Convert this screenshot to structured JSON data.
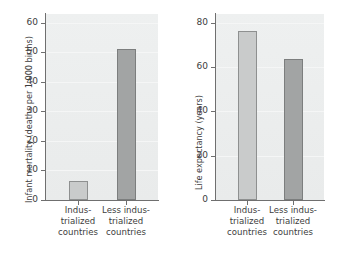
{
  "figure": {
    "background": "#ffffff",
    "plot_background": "#eceeee",
    "bar_color_light": "#c9cbcb",
    "bar_color_dark": "#a2a4a4",
    "bar_border": "#8a8a8a",
    "axis_color": "#6f6f6f"
  },
  "chart_data": [
    {
      "type": "bar",
      "title": "",
      "xlabel": "",
      "ylabel": "Infant mortality (deaths per 1,000 births)",
      "categories": [
        "Indus-\ntrialized\ncountries",
        "Less indus-\ntrialized\ncountries"
      ],
      "values": [
        6.5,
        51
      ],
      "ylim": [
        0,
        63
      ],
      "yticks": [
        0,
        10,
        20,
        30,
        40,
        50,
        60
      ],
      "ytick_labels": [
        "0",
        "10",
        "20",
        "30",
        "40",
        "50",
        "60"
      ],
      "grid": true,
      "legend": "none",
      "bar_colors": [
        "#c9cbcb",
        "#a2a4a4"
      ]
    },
    {
      "type": "bar",
      "title": "",
      "xlabel": "",
      "ylabel": "Life expectancy (years)",
      "categories": [
        "Indus-\ntrialized\ncountries",
        "Less indus-\ntrialized\ncountries"
      ],
      "values": [
        76.5,
        63.5
      ],
      "ylim": [
        0,
        84
      ],
      "yticks": [
        0,
        20,
        40,
        60,
        80
      ],
      "ytick_labels": [
        "0",
        "20",
        "40",
        "60",
        "80"
      ],
      "grid": true,
      "legend": "none",
      "bar_colors": [
        "#c9cbcb",
        "#a2a4a4"
      ]
    }
  ]
}
